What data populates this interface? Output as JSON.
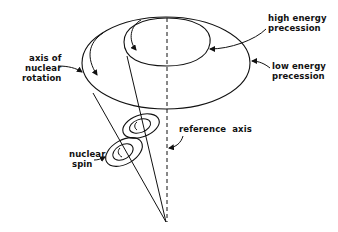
{
  "diagram": {
    "type": "cone-precession-diagram",
    "labels": {
      "axis_of_nuclear_rotation": [
        "axis of",
        "nuclear",
        "rotation"
      ],
      "high_energy_precession": [
        "high energy",
        "precession"
      ],
      "low_energy_precession": [
        "low energy",
        "precession"
      ],
      "reference_axis": "reference  axis",
      "nuclear_spin": [
        "nuclear",
        "spin"
      ]
    },
    "colors": {
      "stroke": "#111111",
      "background": "#ffffff"
    }
  }
}
